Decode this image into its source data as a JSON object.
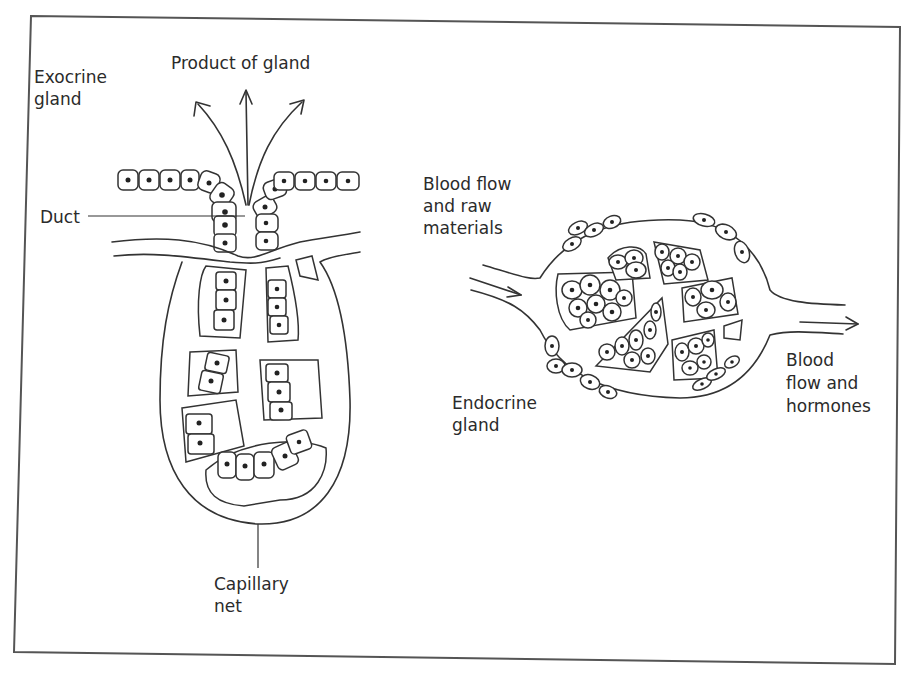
{
  "figure": {
    "frame_color": "#555555",
    "ink_color": "#2b2b2b",
    "background": "#ffffff"
  },
  "exocrine": {
    "title_line1": "Exocrine",
    "title_line2": "gland",
    "product_label": "Product of gland",
    "duct_label": "Duct",
    "capillary_label_line1": "Capillary",
    "capillary_label_line2": "net"
  },
  "endocrine": {
    "title_line1": "Endocrine",
    "title_line2": "gland",
    "inflow_label_line1": "Blood flow",
    "inflow_label_line2": "and raw",
    "inflow_label_line3": "materials",
    "outflow_label_line1": "Blood",
    "outflow_label_line2": "flow and",
    "outflow_label_line3": "hormones"
  }
}
